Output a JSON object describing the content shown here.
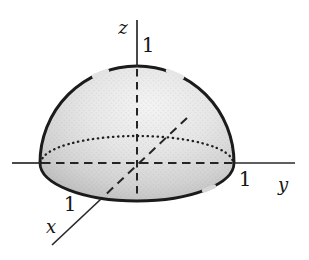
{
  "figure": {
    "type": "3d-surface-sketch",
    "axes": {
      "x": {
        "label": "x",
        "tick": "1"
      },
      "y": {
        "label": "y",
        "tick": "1"
      },
      "z": {
        "label": "z",
        "tick": "1"
      }
    },
    "surface": {
      "shape": "hemisphere",
      "radius_label": "1",
      "hidden_lines": "dashed",
      "back_base_edge": "dotted"
    }
  },
  "colors": {
    "background": "#ffffff",
    "outline": "#1b1b1b",
    "axis_line": "#2a2a2a",
    "label_ink": "#161616",
    "dome_fill_light": "#f3f3f3",
    "dome_fill_mid": "#dedede",
    "dome_fill_dark": "#b7b7b7"
  }
}
